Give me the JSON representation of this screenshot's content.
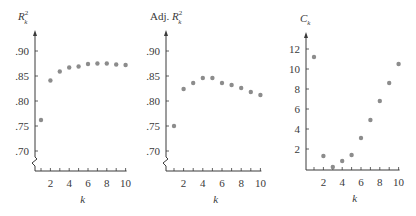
{
  "chart_data": [
    {
      "type": "scatter",
      "title": "R_k^2",
      "title_display": {
        "main": "R",
        "sup": "2",
        "sub": "k"
      },
      "xlabel": "k",
      "ylabel": "R_k^2",
      "x": [
        1,
        2,
        3,
        4,
        5,
        6,
        7,
        8,
        9,
        10
      ],
      "values": [
        0.762,
        0.841,
        0.859,
        0.867,
        0.869,
        0.874,
        0.875,
        0.875,
        0.873,
        0.872
      ],
      "xticks": [
        "2",
        "4",
        "6",
        "8",
        "10"
      ],
      "yticks": [
        ".70",
        ".75",
        ".80",
        ".85",
        ".90"
      ],
      "ylim": [
        0.7,
        0.9
      ],
      "axis_break": true,
      "grid": false
    },
    {
      "type": "scatter",
      "title": "Adj. R_k^2",
      "title_display": {
        "prefix": "Adj. ",
        "main": "R",
        "sup": "2",
        "sub": "k"
      },
      "xlabel": "k",
      "ylabel": "Adj. R_k^2",
      "x": [
        1,
        2,
        3,
        4,
        5,
        6,
        7,
        8,
        9,
        10
      ],
      "values": [
        0.75,
        0.824,
        0.836,
        0.846,
        0.846,
        0.836,
        0.832,
        0.826,
        0.818,
        0.812
      ],
      "xticks": [
        "2",
        "4",
        "6",
        "8",
        "10"
      ],
      "yticks": [
        ".70",
        ".75",
        ".80",
        ".85",
        ".90"
      ],
      "ylim": [
        0.7,
        0.9
      ],
      "axis_break": true,
      "grid": false
    },
    {
      "type": "scatter",
      "title": "C_k",
      "title_display": {
        "main": "C",
        "sub": "k"
      },
      "xlabel": "k",
      "ylabel": "C_k",
      "x": [
        1,
        2,
        3,
        4,
        5,
        6,
        7,
        8,
        9,
        10
      ],
      "values": [
        11.2,
        1.3,
        0.2,
        0.8,
        1.4,
        3.1,
        4.9,
        6.8,
        8.6,
        10.5
      ],
      "xticks": [
        "2",
        "4",
        "6",
        "8",
        "10"
      ],
      "yticks": [
        "2",
        "4",
        "6",
        "8",
        "10",
        "12"
      ],
      "ylim": [
        0,
        12
      ],
      "axis_break": false,
      "grid": false
    }
  ],
  "style": {
    "axis_color": "#3a3a3a",
    "point_color": "#8c8c8c"
  }
}
